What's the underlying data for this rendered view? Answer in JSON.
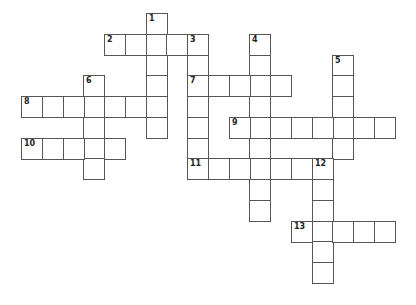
{
  "puzzle": {
    "type": "crossword",
    "cell_size": 20.75,
    "origin": {
      "x": 21,
      "y": 13
    },
    "colors": {
      "border": "#555555",
      "cell": "#ffffff",
      "background": "#ffffff"
    },
    "entries": [
      {
        "number": "1",
        "direction": "down",
        "row": 0,
        "col": 6,
        "length": 6
      },
      {
        "number": "2",
        "direction": "across",
        "row": 1,
        "col": 4,
        "length": 5
      },
      {
        "number": "3",
        "direction": "down",
        "row": 1,
        "col": 8,
        "length": 7
      },
      {
        "number": "4",
        "direction": "down",
        "row": 1,
        "col": 11,
        "length": 9
      },
      {
        "number": "5",
        "direction": "down",
        "row": 2,
        "col": 15,
        "length": 5
      },
      {
        "number": "6",
        "direction": "down",
        "row": 3,
        "col": 3,
        "length": 5
      },
      {
        "number": "7",
        "direction": "across",
        "row": 3,
        "col": 8,
        "length": 5
      },
      {
        "number": "8",
        "direction": "across",
        "row": 4,
        "col": 0,
        "length": 7
      },
      {
        "number": "9",
        "direction": "across",
        "row": 5,
        "col": 10,
        "length": 8
      },
      {
        "number": "10",
        "direction": "across",
        "row": 6,
        "col": 0,
        "length": 5
      },
      {
        "number": "11",
        "direction": "across",
        "row": 7,
        "col": 8,
        "length": 7
      },
      {
        "number": "12",
        "direction": "down",
        "row": 7,
        "col": 14,
        "length": 6
      },
      {
        "number": "13",
        "direction": "across",
        "row": 10,
        "col": 13,
        "length": 5
      }
    ]
  }
}
